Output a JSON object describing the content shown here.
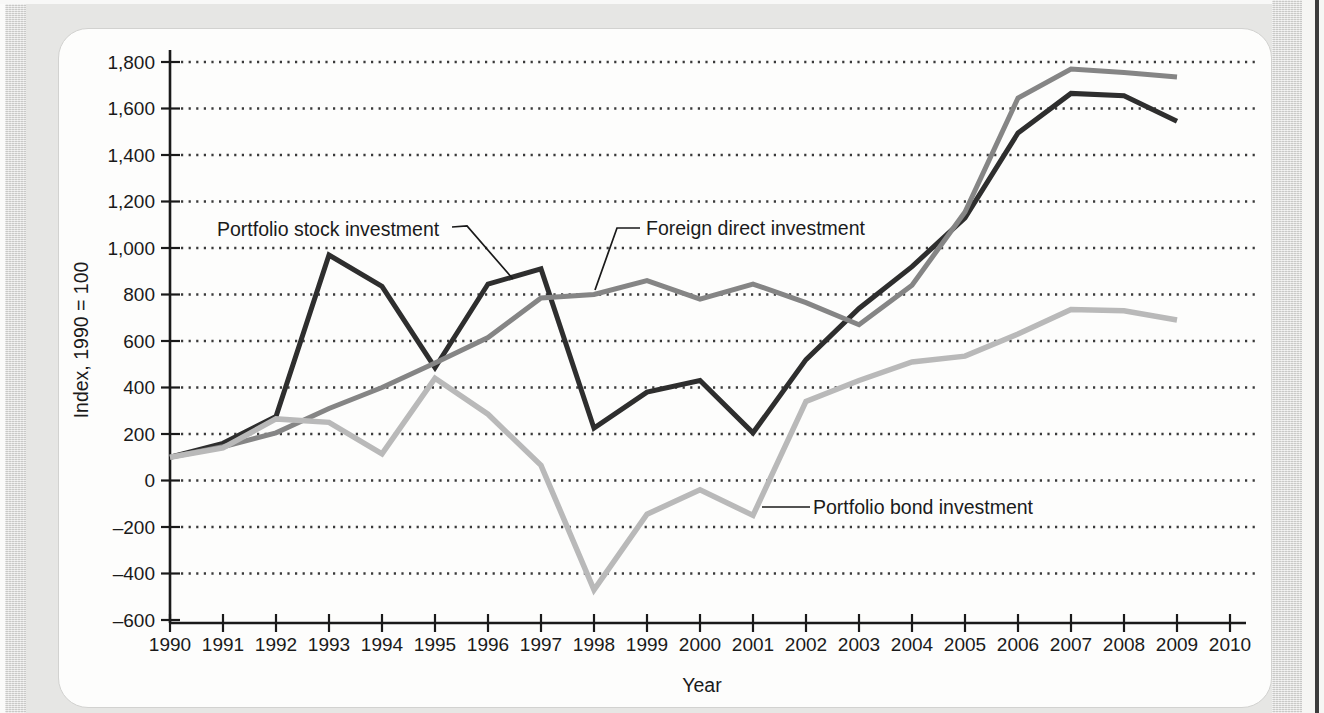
{
  "chart_data": {
    "type": "line",
    "title": "",
    "xlabel": "Year",
    "ylabel": "Index, 1990 = 100",
    "grid": "dotted-horizontal",
    "legend": "inline-annotations",
    "x": [
      1990,
      1991,
      1992,
      1993,
      1994,
      1995,
      1996,
      1997,
      1998,
      1999,
      2000,
      2001,
      2002,
      2003,
      2004,
      2005,
      2006,
      2007,
      2008,
      2009
    ],
    "x_axis": {
      "min": 1990,
      "max": 2010,
      "tick_labels": [
        "1990",
        "1991",
        "1992",
        "1993",
        "1994",
        "1995",
        "1996",
        "1997",
        "1998",
        "1999",
        "2000",
        "2001",
        "2002",
        "2003",
        "2004",
        "2005",
        "2006",
        "2007",
        "2008",
        "2009",
        "2010"
      ]
    },
    "y_axis": {
      "min": -600,
      "max": 1800,
      "step": 200,
      "tick_values": [
        1800,
        1600,
        1400,
        1200,
        1000,
        800,
        600,
        400,
        200,
        0,
        -200,
        -400,
        -600
      ],
      "tick_labels": [
        "1,800",
        "1,600",
        "1,400",
        "1,200",
        "1,000",
        "800",
        "600",
        "400",
        "200",
        "0",
        "–200",
        "–400",
        "–600"
      ]
    },
    "series": [
      {
        "name": "Portfolio stock investment",
        "color": "#2e2e2e",
        "values": [
          100,
          160,
          275,
          970,
          835,
          485,
          845,
          910,
          225,
          380,
          430,
          205,
          520,
          740,
          920,
          1130,
          1495,
          1665,
          1655,
          1545
        ]
      },
      {
        "name": "Foreign direct investment",
        "color": "#858585",
        "values": [
          100,
          145,
          205,
          310,
          400,
          505,
          615,
          785,
          800,
          860,
          780,
          845,
          765,
          670,
          840,
          1155,
          1645,
          1770,
          1755,
          1735
        ]
      },
      {
        "name": "Portfolio bond investment",
        "color": "#b9b9b9",
        "values": [
          100,
          140,
          265,
          250,
          115,
          440,
          285,
          65,
          -470,
          -145,
          -40,
          -150,
          340,
          430,
          510,
          535,
          630,
          735,
          730,
          690
        ]
      }
    ],
    "annotations": [
      {
        "text": "Portfolio stock investment",
        "series_index": 0,
        "points_to_year": 1996
      },
      {
        "text": "Foreign direct investment",
        "series_index": 1,
        "points_to_year": 1998
      },
      {
        "text": "Portfolio bond investment",
        "series_index": 2,
        "points_to_year": 2001
      }
    ]
  }
}
